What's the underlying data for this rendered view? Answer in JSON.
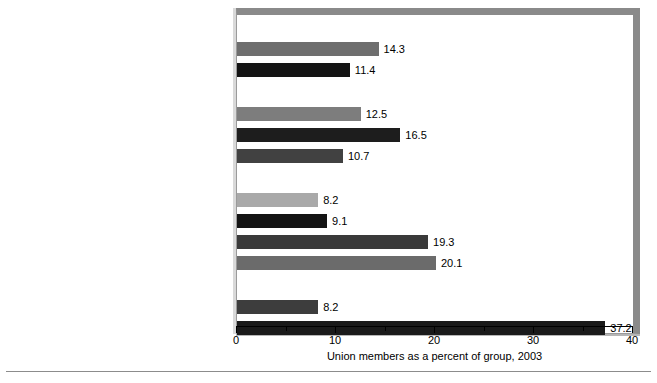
{
  "chart_data": {
    "type": "bar",
    "orientation": "horizontal",
    "title": "",
    "xlabel": "Union members as a percent of group, 2003",
    "ylabel": "",
    "xlim": [
      0,
      40
    ],
    "xticks": [
      0,
      10,
      20,
      30,
      40
    ],
    "xtick_labels": [
      "0",
      "10",
      "20",
      "30",
      "40"
    ],
    "minor_xticks": [
      5,
      15,
      25,
      35
    ],
    "grid": false,
    "legend": "none",
    "footnote_marker": "a",
    "rows": [
      {
        "kind": "header",
        "label": "By Sex",
        "value": null,
        "value_text": "",
        "color": ""
      },
      {
        "kind": "bar",
        "label": "Men",
        "value": 14.3,
        "value_text": "14.3",
        "color": "#6e6e6e"
      },
      {
        "kind": "bar",
        "label": "Women",
        "value": 11.4,
        "value_text": "11.4",
        "color": "#141414"
      },
      {
        "kind": "header",
        "label": "By Race",
        "value": null,
        "value_text": "",
        "color": ""
      },
      {
        "kind": "bar",
        "label": "Whites",
        "value": 12.5,
        "value_text": "12.5",
        "color": "#7d7d7d"
      },
      {
        "kind": "bar",
        "label": "Blacks",
        "value": 16.5,
        "value_text": "16.5",
        "color": "#1d1d1d"
      },
      {
        "kind": "bar",
        "label": "Hispanics",
        "value": 10.7,
        "value_text": "10.7",
        "color": "#414141"
      },
      {
        "kind": "header",
        "label": "By Occupation",
        "value": null,
        "value_text": "",
        "color": ""
      },
      {
        "kind": "bar",
        "label": "Sales, and clerical",
        "value": 8.2,
        "value_text": "8.2",
        "color": "#a9a9a9"
      },
      {
        "kind": "bar",
        "label": "Service",
        "sup": "a",
        "value": 9.1,
        "value_text": "9.1",
        "color": "#141414"
      },
      {
        "kind": "bar",
        "label": "Construction, extraction, and production",
        "value": 19.3,
        "value_text": "19.3",
        "color": "#3a3a3a"
      },
      {
        "kind": "bar",
        "label": "Transportation and material moving",
        "value": 20.1,
        "value_text": "20.1",
        "color": "#6b6b6b"
      },
      {
        "kind": "header",
        "label": "By Sector",
        "value": null,
        "value_text": "",
        "color": ""
      },
      {
        "kind": "bar",
        "label": "Private wage and salary",
        "value": 8.2,
        "value_text": "8.2",
        "color": "#3d3d3d"
      },
      {
        "kind": "bar",
        "label": "Government",
        "value": 37.2,
        "value_text": "37.2",
        "color": "#1a1a1a"
      }
    ]
  },
  "colors": {
    "frame": "#8a8a8a",
    "frame_shadow": "#b6b6b6",
    "axis": "#000000",
    "background": "#ffffff",
    "rule": "#8c8c8c"
  }
}
